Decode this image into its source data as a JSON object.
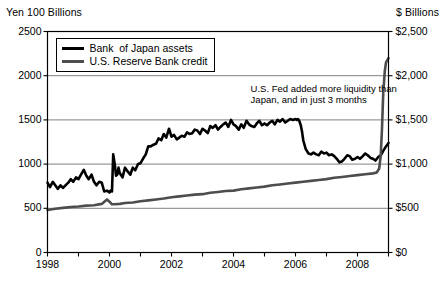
{
  "chart_data": {
    "type": "line",
    "title": "",
    "xlabel": "",
    "ylabel": "Yen 100 Billions",
    "y2label": "$ Billions",
    "grid": true,
    "legend_position": "top-left-inside",
    "xlim": [
      1998.0,
      2009.0
    ],
    "ylim": [
      0,
      2500
    ],
    "y2lim": [
      0,
      2500
    ],
    "y_ticks": [
      0,
      500,
      1000,
      1500,
      2000,
      2500
    ],
    "y_tick_labels": [
      "0",
      "500",
      "1000",
      "1500",
      "2000",
      "2500"
    ],
    "y2_ticks": [
      0,
      500,
      1000,
      1500,
      2000,
      2500
    ],
    "y2_tick_labels": [
      "$0",
      "$500",
      "$1,000",
      "$1,500",
      "$2,000",
      "$2,500"
    ],
    "x_ticks": [
      1998,
      1999,
      2000,
      2001,
      2002,
      2003,
      2004,
      2005,
      2006,
      2007,
      2008,
      2009
    ],
    "x_tick_labels": [
      "1998",
      "",
      "2000",
      "",
      "2002",
      "",
      "2004",
      "",
      "2006",
      "",
      "2008",
      ""
    ],
    "annotations": [
      {
        "name": "fed-liquidity-note",
        "text": "U.S. Fed added more liquidity than\nJapan, and in just 3 months",
        "x": 2005.1,
        "y": 1850
      }
    ],
    "series": [
      {
        "name": "Bank  of Japan assets",
        "color": "#000000",
        "width": 2.6,
        "axis": "left",
        "x": [
          1998.0,
          1998.08,
          1998.17,
          1998.25,
          1998.33,
          1998.42,
          1998.5,
          1998.58,
          1998.67,
          1998.75,
          1998.83,
          1998.92,
          1999.0,
          1999.08,
          1999.17,
          1999.25,
          1999.33,
          1999.42,
          1999.5,
          1999.58,
          1999.67,
          1999.75,
          1999.83,
          1999.92,
          2000.0,
          2000.04,
          2000.08,
          2000.12,
          2000.17,
          2000.21,
          2000.25,
          2000.29,
          2000.33,
          2000.42,
          2000.5,
          2000.58,
          2000.67,
          2000.75,
          2000.83,
          2000.92,
          2001.0,
          2001.08,
          2001.17,
          2001.25,
          2001.33,
          2001.42,
          2001.5,
          2001.58,
          2001.67,
          2001.75,
          2001.83,
          2001.92,
          2002.0,
          2002.08,
          2002.17,
          2002.25,
          2002.33,
          2002.42,
          2002.5,
          2002.58,
          2002.67,
          2002.75,
          2002.83,
          2002.92,
          2003.0,
          2003.08,
          2003.17,
          2003.25,
          2003.33,
          2003.42,
          2003.5,
          2003.58,
          2003.67,
          2003.75,
          2003.83,
          2003.92,
          2004.0,
          2004.08,
          2004.17,
          2004.25,
          2004.33,
          2004.42,
          2004.5,
          2004.58,
          2004.67,
          2004.75,
          2004.83,
          2004.92,
          2005.0,
          2005.08,
          2005.17,
          2005.25,
          2005.33,
          2005.42,
          2005.5,
          2005.58,
          2005.67,
          2005.75,
          2005.83,
          2005.92,
          2006.0,
          2006.04,
          2006.08,
          2006.12,
          2006.17,
          2006.21,
          2006.25,
          2006.33,
          2006.42,
          2006.5,
          2006.58,
          2006.67,
          2006.75,
          2006.83,
          2006.92,
          2007.0,
          2007.08,
          2007.17,
          2007.25,
          2007.33,
          2007.42,
          2007.5,
          2007.58,
          2007.67,
          2007.75,
          2007.83,
          2007.92,
          2008.0,
          2008.08,
          2008.17,
          2008.25,
          2008.33,
          2008.42,
          2008.5,
          2008.58,
          2008.67,
          2008.75,
          2008.83,
          2008.92,
          2009.0
        ],
        "y": [
          790,
          740,
          800,
          760,
          720,
          760,
          730,
          760,
          790,
          830,
          800,
          850,
          830,
          880,
          935,
          870,
          830,
          880,
          800,
          760,
          800,
          790,
          690,
          700,
          680,
          700,
          690,
          1110,
          1000,
          870,
          880,
          960,
          900,
          850,
          960,
          920,
          880,
          960,
          930,
          1000,
          1010,
          1060,
          1110,
          1200,
          1200,
          1220,
          1230,
          1290,
          1270,
          1340,
          1300,
          1400,
          1310,
          1330,
          1280,
          1300,
          1320,
          1310,
          1360,
          1340,
          1350,
          1390,
          1380,
          1340,
          1400,
          1380,
          1350,
          1430,
          1410,
          1440,
          1390,
          1420,
          1450,
          1470,
          1420,
          1500,
          1450,
          1430,
          1390,
          1450,
          1410,
          1490,
          1450,
          1430,
          1420,
          1460,
          1490,
          1440,
          1460,
          1440,
          1470,
          1490,
          1450,
          1500,
          1480,
          1510,
          1470,
          1490,
          1510,
          1500,
          1510,
          1500,
          1510,
          1490,
          1440,
          1370,
          1270,
          1170,
          1120,
          1110,
          1130,
          1110,
          1100,
          1140,
          1120,
          1130,
          1100,
          1110,
          1090,
          1060,
          1020,
          1030,
          1060,
          1100,
          1090,
          1050,
          1060,
          1080,
          1060,
          1090,
          1120,
          1100,
          1070,
          1060,
          1040,
          1080,
          1100,
          1150,
          1200,
          1240
        ]
      },
      {
        "name": "U.S. Reserve Bank credit",
        "color": "#4d4d4d",
        "width": 2.6,
        "axis": "right",
        "x": [
          1998.0,
          1998.25,
          1998.5,
          1998.75,
          1999.0,
          1999.25,
          1999.5,
          1999.75,
          1999.92,
          2000.0,
          2000.08,
          2000.17,
          2000.33,
          2000.5,
          2000.75,
          2001.0,
          2001.25,
          2001.5,
          2001.75,
          2002.0,
          2002.25,
          2002.5,
          2002.75,
          2003.0,
          2003.25,
          2003.5,
          2003.75,
          2004.0,
          2004.25,
          2004.5,
          2004.75,
          2005.0,
          2005.25,
          2005.5,
          2005.75,
          2006.0,
          2006.25,
          2006.5,
          2006.75,
          2007.0,
          2007.25,
          2007.5,
          2007.75,
          2008.0,
          2008.25,
          2008.5,
          2008.62,
          2008.7,
          2008.75,
          2008.79,
          2008.83,
          2008.88,
          2008.92,
          2009.0
        ],
        "y": [
          480,
          495,
          505,
          515,
          520,
          530,
          535,
          550,
          600,
          575,
          545,
          545,
          550,
          560,
          565,
          580,
          590,
          600,
          610,
          625,
          635,
          645,
          655,
          660,
          675,
          685,
          695,
          700,
          715,
          725,
          735,
          745,
          760,
          770,
          780,
          790,
          800,
          810,
          820,
          830,
          845,
          855,
          865,
          875,
          885,
          895,
          905,
          950,
          1100,
          1400,
          1800,
          2050,
          2150,
          2200
        ]
      }
    ]
  },
  "legend": {
    "entries": [
      {
        "label": "Bank  of Japan assets",
        "color": "#000000"
      },
      {
        "label": "U.S. Reserve Bank credit",
        "color": "#4d4d4d"
      }
    ]
  },
  "axes": {
    "left_title": "Yen 100 Billions",
    "right_title": "$ Billions"
  }
}
